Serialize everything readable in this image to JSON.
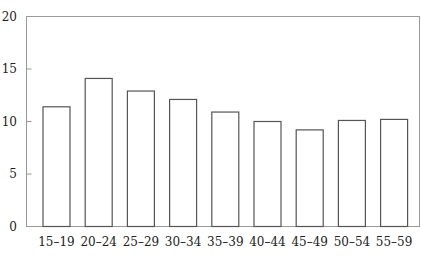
{
  "chart_data": {
    "type": "bar",
    "title": "",
    "xlabel": "",
    "ylabel": "",
    "categories": [
      "15–19",
      "20–24",
      "25–29",
      "30–34",
      "35–39",
      "40–44",
      "45–49",
      "50–54",
      "55–59"
    ],
    "values": [
      11.4,
      14.1,
      12.9,
      12.1,
      10.9,
      10.0,
      9.2,
      10.1,
      10.2
    ],
    "ylim": [
      0,
      20
    ],
    "yticks": [
      0,
      5,
      10,
      15,
      20
    ],
    "grid": false,
    "legend": null,
    "bar_fill": "#ffffff",
    "bar_stroke": "#555555",
    "axis_color": "#888888"
  }
}
